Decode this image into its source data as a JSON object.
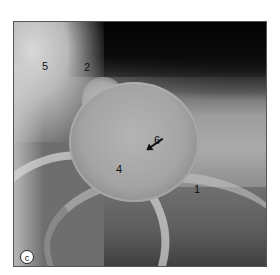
{
  "figure": {
    "type": "shoulder radiograph",
    "panel_label": "c",
    "labels": [
      {
        "id": "label-5",
        "text": "5",
        "x": 28,
        "y": 39
      },
      {
        "id": "label-2",
        "text": "2",
        "x": 70,
        "y": 40
      },
      {
        "id": "label-6",
        "text": "6",
        "x": 140,
        "y": 113
      },
      {
        "id": "label-4",
        "text": "4",
        "x": 102,
        "y": 142
      },
      {
        "id": "label-1",
        "text": "1",
        "x": 180,
        "y": 162
      }
    ],
    "arrow": {
      "points_to": "label-6 structure",
      "direction": "down-left"
    }
  }
}
